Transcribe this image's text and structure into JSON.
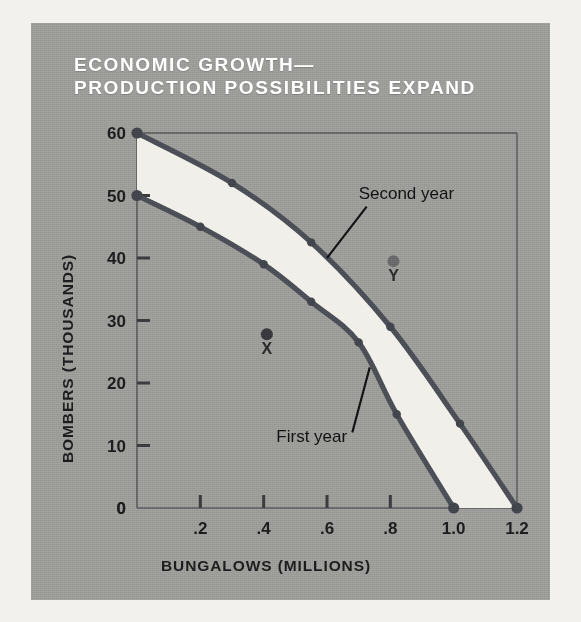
{
  "figure": {
    "title": "ECONOMIC GROWTH—\nPRODUCTION POSSIBILITIES EXPAND",
    "background_color": "#9d9d99",
    "page_color": "#f2f1ee",
    "title_color": "#ffffff"
  },
  "chart_data": {
    "type": "line",
    "title": "ECONOMIC GROWTH— PRODUCTION POSSIBILITIES EXPAND",
    "xlabel": "BUNGALOWS (MILLIONS)",
    "ylabel": "BOMBERS (THOUSANDS)",
    "xlim": [
      0,
      1.2
    ],
    "ylim": [
      0,
      60
    ],
    "xticks": [
      0,
      0.2,
      0.4,
      0.6,
      0.8,
      1.0,
      1.2
    ],
    "xticklabels": [
      "0",
      ".2",
      ".4",
      ".6",
      ".8",
      "1.0",
      "1.2"
    ],
    "yticks": [
      0,
      10,
      20,
      30,
      40,
      50,
      60
    ],
    "yticklabels": [
      "0",
      "10",
      "20",
      "30",
      "40",
      "50",
      "60"
    ],
    "grid": false,
    "legend_position": "inline-annotations",
    "fill_between_label": "growth band",
    "fill_color": "#f0efe9",
    "curve_color": "#4d4f58",
    "series": [
      {
        "name": "First year",
        "label": "First year",
        "color": "#4d4f58",
        "x": [
          0.0,
          0.2,
          0.4,
          0.55,
          0.7,
          0.82,
          1.0
        ],
        "y": [
          50,
          45,
          39,
          33,
          26.5,
          15,
          0
        ]
      },
      {
        "name": "Second year",
        "label": "Second year",
        "color": "#4d4f58",
        "x": [
          0.0,
          0.3,
          0.55,
          0.8,
          1.02,
          1.2
        ],
        "y": [
          60,
          52,
          42.5,
          29,
          13.5,
          0
        ]
      }
    ],
    "annotations": [
      {
        "name": "point-x",
        "label": "X",
        "x": 0.41,
        "y": 27.8,
        "color": "#3a3a3e"
      },
      {
        "name": "point-y",
        "label": "Y",
        "x": 0.81,
        "y": 39.5,
        "color": "#6a6a6c"
      },
      {
        "name": "first-year-callout",
        "label": "First year",
        "text_x": 0.44,
        "text_y": 10.5
      },
      {
        "name": "second-year-callout",
        "label": "Second year",
        "text_x": 0.7,
        "text_y": 49.5
      }
    ]
  }
}
